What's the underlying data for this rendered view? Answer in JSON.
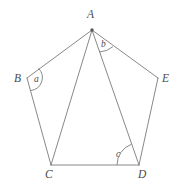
{
  "figure": {
    "kind": "geometry-diagram",
    "stroke_color": "#7a7a7a",
    "label_color": "#4a4a4a",
    "background_color": "#ffffff",
    "stroke_width": 0.9,
    "vertices": [
      {
        "name": "A",
        "label": "A",
        "x": 92,
        "y": 30,
        "dot": true
      },
      {
        "name": "B",
        "label": "B",
        "x": 27,
        "y": 78,
        "dot": false
      },
      {
        "name": "C",
        "label": "C",
        "x": 51,
        "y": 165,
        "dot": false
      },
      {
        "name": "D",
        "label": "D",
        "x": 139,
        "y": 165,
        "dot": false
      },
      {
        "name": "E",
        "label": "E",
        "x": 158,
        "y": 78,
        "dot": false
      }
    ],
    "edges": [
      {
        "name": "side-AB",
        "from": "A",
        "to": "B"
      },
      {
        "name": "side-BC",
        "from": "B",
        "to": "C"
      },
      {
        "name": "side-CD",
        "from": "C",
        "to": "D"
      },
      {
        "name": "side-DE",
        "from": "D",
        "to": "E"
      },
      {
        "name": "side-EA",
        "from": "E",
        "to": "A"
      },
      {
        "name": "diagonal-AC",
        "from": "A",
        "to": "C"
      },
      {
        "name": "diagonal-AD",
        "from": "A",
        "to": "D"
      }
    ],
    "angles": [
      {
        "name": "angle-a",
        "label": "a",
        "at": "B",
        "between": [
          "A",
          "C"
        ],
        "label_x": 38,
        "label_y": 80
      },
      {
        "name": "angle-b",
        "label": "b",
        "at": "A",
        "between": [
          "D",
          "E"
        ],
        "label_x": 105,
        "label_y": 46
      },
      {
        "name": "angle-c",
        "label": "c",
        "at": "D",
        "between": [
          "C",
          "A"
        ],
        "label_x": 120,
        "label_y": 156
      }
    ]
  }
}
